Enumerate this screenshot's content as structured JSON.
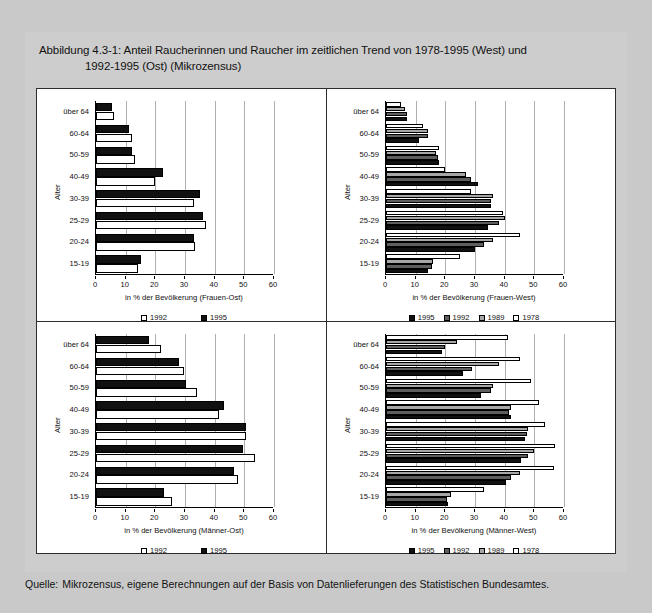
{
  "figure": {
    "title_line1": "Abbildung 4.3-1: Anteil Raucherinnen und Raucher im zeitlichen Trend von 1978-1995 (West) und",
    "title_line2": "1992-1995 (Ost) (Mikrozensus)",
    "source_label": "Quelle:",
    "source_text": "Mikrozensus, eigene Berechnungen auf der Basis von Datenlieferungen des Statistischen Bundesamtes."
  },
  "axis": {
    "y_title": "Alter",
    "categories": [
      "über 64",
      "60-64",
      "50-59",
      "40-49",
      "30-39",
      "25-29",
      "20-24",
      "15-19"
    ],
    "xticks": [
      "0",
      "10",
      "20",
      "30",
      "40",
      "50",
      "60"
    ],
    "xlim": [
      0,
      60
    ]
  },
  "colors": {
    "y1995": "#111111",
    "y1992": "#5e5e5e",
    "y1989": "#a6a6a6",
    "y1978": "#ffffff",
    "ost_1992": "#ffffff",
    "ost_1995": "#111111",
    "panel_bg": "#ffffff",
    "page_bg": "#c9c9c9",
    "grid": "#b0b0b0"
  },
  "legends": {
    "ost": [
      {
        "label": "1992",
        "swatch": "swO1992"
      },
      {
        "label": "1995",
        "swatch": "swO1995"
      }
    ],
    "west": [
      {
        "label": "1995",
        "swatch": "sw1995"
      },
      {
        "label": "1992",
        "swatch": "sw1992"
      },
      {
        "label": "1989",
        "swatch": "sw1989"
      },
      {
        "label": "1978",
        "swatch": "sw1978"
      }
    ]
  },
  "chart_data": [
    {
      "id": "frauen-ost",
      "type": "bar",
      "orientation": "horizontal",
      "title": "",
      "xlabel": "in % der Bevölkerung (Frauen-Ost)",
      "ylabel": "Alter",
      "xlim": [
        0,
        60
      ],
      "grid": true,
      "legend_position": "bottom",
      "categories": [
        "über 64",
        "60-64",
        "50-59",
        "40-49",
        "30-39",
        "25-29",
        "20-24",
        "15-19"
      ],
      "series": [
        {
          "name": "1995",
          "color": "#111111",
          "values": [
            5.5,
            11.0,
            12.0,
            22.5,
            35.0,
            36.0,
            33.0,
            15.0
          ]
        },
        {
          "name": "1992",
          "color": "#ffffff",
          "values": [
            6.0,
            12.0,
            13.0,
            19.8,
            33.0,
            37.0,
            33.5,
            14.0
          ]
        }
      ]
    },
    {
      "id": "frauen-west",
      "type": "bar",
      "orientation": "horizontal",
      "title": "",
      "xlabel": "in % der Bevölkerung (Frauen-West)",
      "ylabel": "Alter",
      "xlim": [
        0,
        60
      ],
      "grid": true,
      "legend_position": "bottom",
      "categories": [
        "über 64",
        "60-64",
        "50-59",
        "40-49",
        "30-39",
        "25-29",
        "20-24",
        "15-19"
      ],
      "series": [
        {
          "name": "1978",
          "color": "#ffffff",
          "values": [
            5.0,
            12.5,
            18.0,
            20.0,
            28.5,
            39.5,
            45.0,
            25.0
          ]
        },
        {
          "name": "1989",
          "color": "#a6a6a6",
          "values": [
            6.5,
            14.0,
            17.0,
            27.0,
            36.0,
            40.0,
            36.0,
            16.0
          ]
        },
        {
          "name": "1992",
          "color": "#5e5e5e",
          "values": [
            7.0,
            14.0,
            17.5,
            28.5,
            35.5,
            38.0,
            33.0,
            15.5
          ]
        },
        {
          "name": "1995",
          "color": "#111111",
          "values": [
            7.0,
            11.0,
            18.0,
            31.0,
            35.5,
            34.5,
            30.0,
            14.0
          ]
        }
      ]
    },
    {
      "id": "maenner-ost",
      "type": "bar",
      "orientation": "horizontal",
      "title": "",
      "xlabel": "in % der Bevölkerung (Männer-Ost)",
      "ylabel": "Alter",
      "xlim": [
        0,
        60
      ],
      "grid": true,
      "legend_position": "bottom",
      "categories": [
        "über 64",
        "60-64",
        "50-59",
        "40-49",
        "30-39",
        "25-29",
        "20-24",
        "15-19"
      ],
      "series": [
        {
          "name": "1995",
          "color": "#111111",
          "values": [
            18.0,
            28.0,
            30.5,
            43.0,
            50.5,
            49.5,
            46.5,
            23.0
          ]
        },
        {
          "name": "1992",
          "color": "#ffffff",
          "values": [
            22.0,
            29.5,
            34.0,
            41.5,
            50.5,
            53.5,
            48.0,
            25.5
          ]
        }
      ]
    },
    {
      "id": "maenner-west",
      "type": "bar",
      "orientation": "horizontal",
      "title": "",
      "xlabel": "in % der Bevölkerung (Männer-West)",
      "ylabel": "Alter",
      "xlim": [
        0,
        60
      ],
      "grid": true,
      "legend_position": "bottom",
      "categories": [
        "über 64",
        "60-64",
        "50-59",
        "40-49",
        "30-39",
        "25-29",
        "20-24",
        "15-19"
      ],
      "series": [
        {
          "name": "1978",
          "color": "#ffffff",
          "values": [
            41.0,
            45.0,
            49.0,
            51.5,
            53.5,
            57.0,
            56.5,
            33.0
          ]
        },
        {
          "name": "1989",
          "color": "#a6a6a6",
          "values": [
            24.0,
            38.0,
            36.0,
            42.0,
            48.0,
            50.0,
            45.0,
            22.0
          ]
        },
        {
          "name": "1992",
          "color": "#5e5e5e",
          "values": [
            20.0,
            29.0,
            35.5,
            41.5,
            47.5,
            48.0,
            42.0,
            20.5
          ]
        },
        {
          "name": "1995",
          "color": "#111111",
          "values": [
            19.0,
            26.0,
            32.0,
            42.0,
            47.0,
            45.5,
            40.5,
            21.0
          ]
        }
      ]
    }
  ]
}
